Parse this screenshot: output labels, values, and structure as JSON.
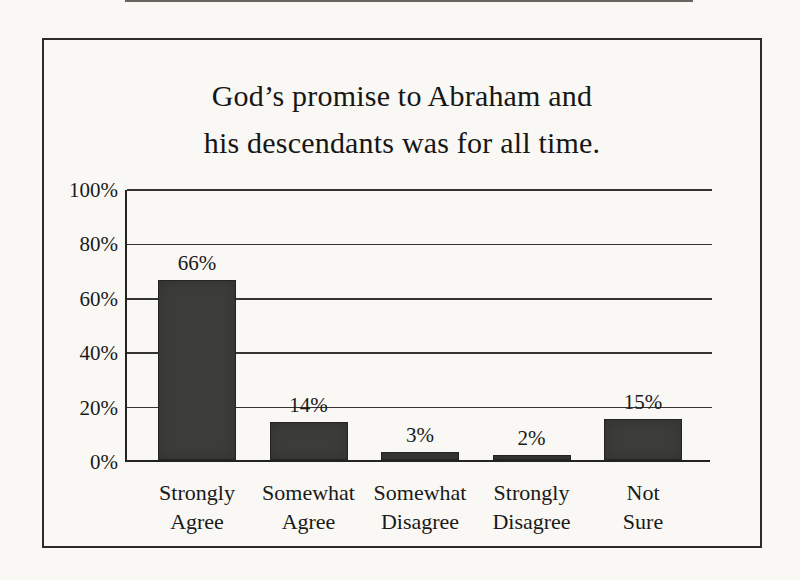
{
  "colors": {
    "paper": "#f9f8f5",
    "bar": "#3c3c3a",
    "line": "#232321",
    "text": "#1a1a18"
  },
  "chart_data": {
    "type": "bar",
    "title": "God’s promise to Abraham and his descendants was for all time.",
    "title_lines": [
      "God’s promise to Abraham and",
      "his descendants was for all time."
    ],
    "categories": [
      "Strongly\nAgree",
      "Somewhat\nAgree",
      "Somewhat\nDisagree",
      "Strongly\nDisagree",
      "Not\nSure"
    ],
    "values": [
      66,
      14,
      3,
      2,
      15
    ],
    "value_labels": [
      "66%",
      "14%",
      "3%",
      "2%",
      "15%"
    ],
    "xlabel": "",
    "ylabel": "",
    "ylim": [
      0,
      100
    ],
    "y_axis": {
      "max": 100,
      "ticks": [
        {
          "value": 0,
          "label": "0%"
        },
        {
          "value": 20,
          "label": "20%"
        },
        {
          "value": 40,
          "label": "40%"
        },
        {
          "value": 60,
          "label": "60%"
        },
        {
          "value": 80,
          "label": "80%"
        },
        {
          "value": 100,
          "label": "100%"
        }
      ]
    },
    "grid": "horizontal",
    "legend": "none"
  }
}
